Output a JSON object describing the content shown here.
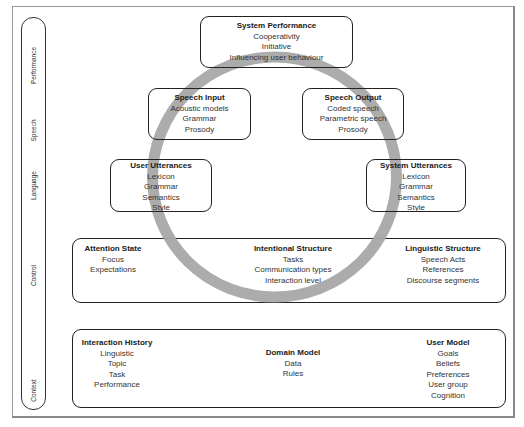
{
  "layers": [
    {
      "label": "Performance"
    },
    {
      "label": "Speech"
    },
    {
      "label": "Language"
    },
    {
      "label": "Control"
    },
    {
      "label": "Context"
    }
  ],
  "nodes": {
    "system_performance": {
      "title": "System Performance",
      "items": [
        "Cooperativity",
        "Initiative",
        "Influencing user behaviour"
      ]
    },
    "speech_input": {
      "title": "Speech Input",
      "items": [
        "Acoustic models",
        "Grammar",
        "Prosody"
      ]
    },
    "speech_output": {
      "title": "Speech Output",
      "items": [
        "Coded speech",
        "Parametric speech",
        "Prosody"
      ]
    },
    "user_utterances": {
      "title": "User Utterances",
      "items": [
        "Lexicon",
        "Grammar",
        "Semantics",
        "Style"
      ]
    },
    "system_utterances": {
      "title": "System Utterances",
      "items": [
        "Lexicon",
        "Grammar",
        "Semantics",
        "Style"
      ]
    }
  },
  "control": {
    "attention_state": {
      "title": "Attention State",
      "items": [
        "Focus",
        "Expectations"
      ]
    },
    "intentional_structure": {
      "title": "Intentional Structure",
      "items": [
        "Tasks",
        "Communication types",
        "Interaction level"
      ]
    },
    "linguistic_structure": {
      "title": "Linguistic Structure",
      "items": [
        "Speech Acts",
        "References",
        "Discourse segments"
      ]
    }
  },
  "context": {
    "interaction_history": {
      "title": "Interaction History",
      "items": [
        "Linguistic",
        "Topic",
        "Task",
        "Performance"
      ]
    },
    "domain_model": {
      "title": "Domain Model",
      "items": [
        "Data",
        "Rules"
      ]
    },
    "user_model": {
      "title": "User Model",
      "items": [
        "Goals",
        "Beliefs",
        "Preferences",
        "User group",
        "Cognition"
      ]
    }
  },
  "colors": {
    "ring": "#a8a8a8",
    "border": "#222222",
    "frame": "#9a9a9a"
  }
}
